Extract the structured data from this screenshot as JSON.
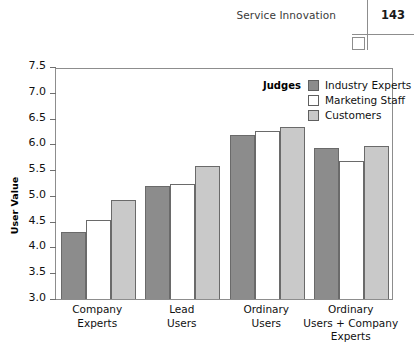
{
  "running_head": {
    "title": "Service Innovation",
    "page_number": "143",
    "box_icon": "empty-square-icon"
  },
  "chart_data": {
    "type": "bar",
    "title": "",
    "xlabel": "",
    "ylabel": "User Value",
    "ylim": [
      3.0,
      7.5
    ],
    "ytick_labels": [
      "3.0",
      "3.5",
      "4.0",
      "4.5",
      "5.0",
      "5.5",
      "6.0",
      "6.5",
      "7.0",
      "7.5"
    ],
    "ytick_values": [
      3.0,
      3.5,
      4.0,
      4.5,
      5.0,
      5.5,
      6.0,
      6.5,
      7.0,
      7.5
    ],
    "grid": false,
    "legend_position": "top-right",
    "legend_title": "Judges",
    "categories": [
      "Company\nExperts",
      "Lead\nUsers",
      "Ordinary\nUsers",
      "Ordinary\nUsers + Company\nExperts"
    ],
    "category_lines": [
      [
        "Company",
        "Experts"
      ],
      [
        "Lead",
        "Users"
      ],
      [
        "Ordinary",
        "Users"
      ],
      [
        "Ordinary",
        "Users + Company",
        "Experts"
      ]
    ],
    "series": [
      {
        "name": "Industry Experts",
        "color": "#8c8c8c",
        "values": [
          4.3,
          5.2,
          6.18,
          5.93
        ]
      },
      {
        "name": "Marketing Staff",
        "color": "#ffffff",
        "values": [
          4.54,
          5.23,
          6.26,
          5.67
        ]
      },
      {
        "name": "Customers",
        "color": "#c9c9c9",
        "values": [
          4.92,
          5.58,
          6.34,
          5.96
        ]
      }
    ]
  }
}
